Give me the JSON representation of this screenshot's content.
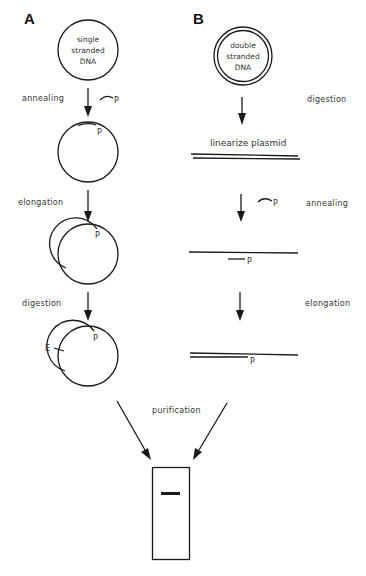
{
  "panels": {
    "A": {
      "label": "A",
      "start": {
        "line1": "single",
        "line2": "stranded",
        "line3": "DNA"
      },
      "steps": [
        {
          "label": "annealing",
          "primer_label": "P"
        },
        {
          "label": "elongation",
          "primer_label": "P"
        },
        {
          "label": "digestion",
          "primer_label": "P",
          "enzyme_label": "E"
        }
      ]
    },
    "B": {
      "label": "B",
      "start": {
        "line1": "double",
        "line2": "stranded",
        "line3": "DNA"
      },
      "steps": [
        {
          "label": "digestion",
          "result_label": "linearize plasmid"
        },
        {
          "label": "annealing",
          "primer_label": "P"
        },
        {
          "label": "elongation",
          "primer_label": "P"
        }
      ]
    }
  },
  "merge": {
    "label": "purification"
  },
  "colors": {
    "ink": "#1a1a1a",
    "background": "#ffffff"
  }
}
